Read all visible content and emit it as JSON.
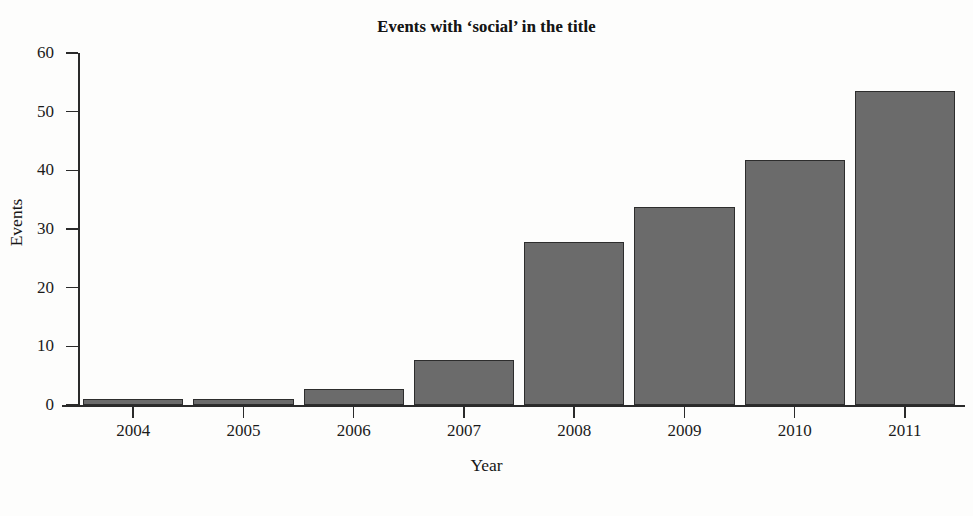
{
  "chart_data": {
    "type": "bar",
    "title": "Events with ‘social’ in the title",
    "xlabel": "Year",
    "ylabel": "Events",
    "categories": [
      "2004",
      "2005",
      "2006",
      "2007",
      "2008",
      "2009",
      "2010",
      "2011"
    ],
    "values": [
      1.0,
      1.0,
      2.7,
      7.7,
      27.8,
      33.8,
      41.8,
      53.5
    ],
    "ylim": [
      0,
      60
    ],
    "yticks": [
      0,
      10,
      20,
      30,
      40,
      50,
      60
    ],
    "ytick_labels": [
      "0",
      "10",
      "20",
      "30",
      "40",
      "50",
      "60"
    ],
    "grid": false,
    "legend": false,
    "bar_color": "#6b6b6b",
    "bar_edge_color": "#2d2d2d",
    "axis_color": "#2a2a2a",
    "background_color": "#fdfdfc"
  }
}
